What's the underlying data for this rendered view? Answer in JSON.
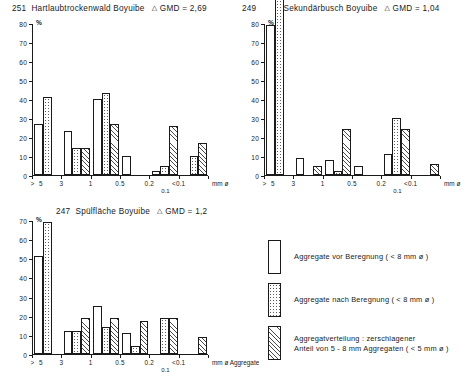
{
  "figure": {
    "axis_suffix_label": "Aggregate",
    "percent_symbol": "%",
    "sub_tick_label": "0.1"
  },
  "chart_data": [
    {
      "type": "bar",
      "panel_id": "251",
      "title": "Hartlaubtrockenwald Boyuibe",
      "gmd_label": "GMD =",
      "gmd_value": "2,69",
      "delta_symbol": "△",
      "xlabel": "mm ø",
      "ylabel": "%",
      "ylim": [
        0,
        80
      ],
      "yticks": [
        0,
        10,
        20,
        30,
        40,
        50,
        60,
        70,
        80
      ],
      "categories": [
        "> 5",
        "3",
        "1",
        "0.5",
        "0.2",
        "< 0.1"
      ],
      "tick_labels": [
        ">",
        "5",
        "3",
        "1",
        "0.5",
        "0.2",
        "<0.1"
      ],
      "grid": false,
      "series": [
        {
          "name": "Aggregate vor Beregnung",
          "pattern": "plain",
          "values": [
            27,
            23,
            40,
            10,
            2,
            0
          ]
        },
        {
          "name": "Aggregate nach Beregnung",
          "pattern": "dotted",
          "values": [
            41,
            14,
            43,
            0,
            5,
            10
          ]
        },
        {
          "name": "Aggregatverteilung zerschlagener Anteil",
          "pattern": "hatched",
          "values": [
            0,
            14,
            27,
            0,
            26,
            17
          ]
        }
      ]
    },
    {
      "type": "bar",
      "panel_id": "249",
      "title": "Sekundärbusch Boyuibe",
      "gmd_label": "GMD =",
      "gmd_value": "1,04",
      "delta_symbol": "△",
      "xlabel": "mm ø",
      "ylabel": "%",
      "ylim": [
        0,
        80
      ],
      "yticks": [
        0,
        10,
        20,
        30,
        40,
        50,
        60,
        70,
        80
      ],
      "categories": [
        "> 5",
        "3",
        "1",
        "0.5",
        "0.2",
        "< 0.1"
      ],
      "tick_labels": [
        ">",
        "5",
        "3",
        "1",
        "0.5",
        "0.2",
        "<0.1"
      ],
      "grid": false,
      "note": "dotted bar in first group exceeds axis maximum (clipped above 80)",
      "series": [
        {
          "name": "Aggregate vor Beregnung",
          "pattern": "plain",
          "values": [
            79,
            9,
            8,
            5,
            11,
            0
          ]
        },
        {
          "name": "Aggregate nach Beregnung",
          "pattern": "dotted",
          "values": [
            92,
            0,
            2,
            0,
            30,
            0
          ]
        },
        {
          "name": "Aggregatverteilung zerschlagener Anteil",
          "pattern": "hatched",
          "values": [
            0,
            5,
            24,
            0,
            24,
            6
          ]
        }
      ]
    },
    {
      "type": "bar",
      "panel_id": "247",
      "title": "Spülfläche Boyuibe",
      "gmd_label": "GMD =",
      "gmd_value": "1,2",
      "delta_symbol": "△",
      "xlabel": "mm ø",
      "ylabel": "%",
      "ylim": [
        0,
        70
      ],
      "yticks": [
        0,
        10,
        20,
        30,
        40,
        50,
        60,
        70
      ],
      "categories": [
        "> 5",
        "3",
        "1",
        "0.5",
        "0.2",
        "< 0.1"
      ],
      "tick_labels": [
        ">",
        "5",
        "3",
        "1",
        "0.5",
        "0.2",
        "<0.1"
      ],
      "grid": false,
      "series": [
        {
          "name": "Aggregate vor Beregnung",
          "pattern": "plain",
          "values": [
            51,
            12,
            25,
            11,
            0,
            0
          ]
        },
        {
          "name": "Aggregate nach Beregnung",
          "pattern": "dotted",
          "values": [
            69,
            12,
            14,
            4,
            19,
            0
          ]
        },
        {
          "name": "Aggregatverteilung zerschlagener Anteil",
          "pattern": "hatched",
          "values": [
            0,
            19,
            19,
            17,
            19,
            9
          ]
        }
      ]
    }
  ],
  "legend": {
    "position": "bottom-right",
    "items": [
      {
        "pattern": "plain",
        "lines": [
          "Aggregate vor Beregnung  ( < 8 mm ø )"
        ]
      },
      {
        "pattern": "dotted",
        "lines": [
          "Aggregate nach Beregnung ( < 8 mm ø )"
        ]
      },
      {
        "pattern": "hatched",
        "lines": [
          "Aggregatverteilung : zerschlagener",
          "Anteil von 5 - 8 mm Aggregaten ( < 5 mm ø )"
        ]
      }
    ]
  }
}
